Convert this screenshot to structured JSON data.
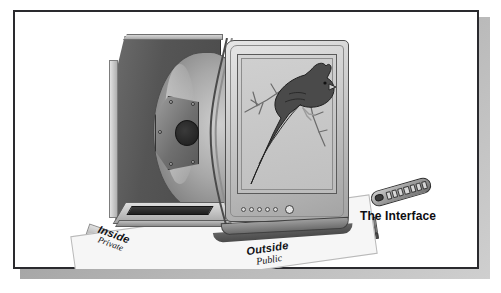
{
  "figure": {
    "border_color": "#2a2a2e",
    "background_color": "#ffffff",
    "shadow_color": "#9a9a9a"
  },
  "labels": {
    "inside": {
      "main": "Inside",
      "sub": "Private",
      "bar_color": "#c2c2c2",
      "text_color": "#101014"
    },
    "outside": {
      "main": "Outside",
      "sub": "Public",
      "bar_color": "#6e6e6e",
      "text_color": "#101014"
    },
    "interface": {
      "main": "The Interface",
      "text_color": "#0d0d11"
    }
  },
  "television": {
    "name": "crt-television",
    "cabinet_color": "#555555",
    "bezel_color": "#cfcfcf",
    "screen_color": "#c6c6c6",
    "controls": {
      "button_count": 5,
      "power_button": "power-button",
      "button_color": "#d9d9d9"
    },
    "internals": [
      "crt-picture-tube",
      "deflection-yoke-plate",
      "mounting-bolts",
      "chassis-circuit-board"
    ]
  },
  "screen_content": {
    "name": "cardinal-bird-illustration",
    "subject": "cardinal bird perched on a branch",
    "body_color": "#4a4a4a",
    "branch_color": "#b9b9b9"
  },
  "remote": {
    "name": "tv-remote-control",
    "body_color": "#9d9d9d",
    "key_rows": 7,
    "has_ir_window": true
  }
}
